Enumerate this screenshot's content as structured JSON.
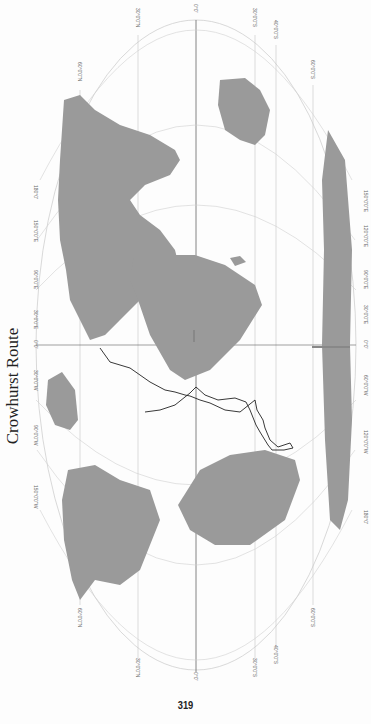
{
  "page": {
    "title": "Crowhurst Route",
    "page_number": "319",
    "orientation": "rotated 90° clockwise"
  },
  "map": {
    "projection": "elliptical world projection (Mollweide-like)",
    "colors": {
      "land": "#9a9a9a",
      "ocean": "#ffffff",
      "graticule": "#c8c8c8",
      "route": "#222222",
      "meridian_zero": "#555555"
    },
    "latitude_labels": [
      "60°0'0\"N",
      "30°0'0\"N",
      "0°0'",
      "30°0'0\"S",
      "40°0'0\"S",
      "60°0'0\"S"
    ],
    "longitude_labels": [
      "180°0'",
      "150°0'0\"W",
      "120°0'0\"W",
      "90°0'0\"W",
      "60°0'0\"W",
      "30°0'0\"W",
      "0°0'",
      "30°0'0\"E",
      "60°0'0\"E",
      "90°0'0\"E",
      "120°0'0\"E",
      "150°0'0\"E",
      "180°0'"
    ],
    "longitude_labels_south_edge": [
      "150°0'0\"E",
      "120°0'0\"E",
      "90°0'0\"E",
      "30°0'0\"E",
      "0°0'",
      "60°0'0\"W",
      "120°0'0\"W",
      "180°0'"
    ],
    "route": {
      "name": "Crowhurst Route",
      "description": "Track from English Channel south through the Atlantic to South America coast and back north"
    },
    "annotations": [
      "small label near 0° meridian",
      "small label at Antarctica prime meridian"
    ]
  }
}
